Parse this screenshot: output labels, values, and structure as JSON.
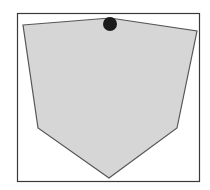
{
  "diagram": {
    "colors": {
      "background": "#ffffff",
      "frame_stroke": "#3a3a3a",
      "polygon_fill": "#d6d6d6",
      "polygon_stroke": "#555555",
      "dot_fill": "#1c1c1c"
    }
  }
}
